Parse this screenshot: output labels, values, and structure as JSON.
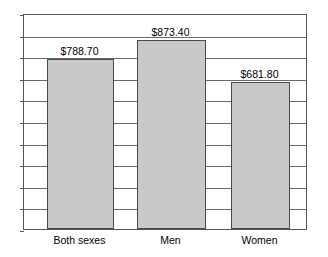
{
  "chart_data": {
    "type": "bar",
    "title": "",
    "subtitle": "",
    "xlabel": "",
    "ylabel": "",
    "categories": [
      "Both sexes",
      "Men",
      "Women"
    ],
    "values": [
      788.7,
      681.8,
      873.4
    ],
    "series": [
      {
        "name": "Average weekly earnings",
        "values": [
          788.7,
          873.4,
          681.8
        ]
      }
    ],
    "data_labels": [
      "$788.70",
      "$873.40",
      "$681.80"
    ],
    "ylim": [
      0,
      1000
    ],
    "y_gridline_values": [
      0,
      100,
      200,
      300,
      400,
      500,
      600,
      700,
      800,
      900,
      1000
    ],
    "y_tick_labels": [],
    "grid": true,
    "legend": false,
    "legend_position": "none",
    "bar_fill_color": "#c9c9c9",
    "bar_border_color": "#4a4a4a",
    "gridline_color": "#6a6a6a",
    "frame_color": "#555555",
    "background_color": "#ffffff"
  },
  "bars": [
    {
      "label": "Both sexes",
      "value_label": "$788.70"
    },
    {
      "label": "Men",
      "value_label": "$873.40"
    },
    {
      "label": "Women",
      "value_label": "$681.80"
    }
  ]
}
